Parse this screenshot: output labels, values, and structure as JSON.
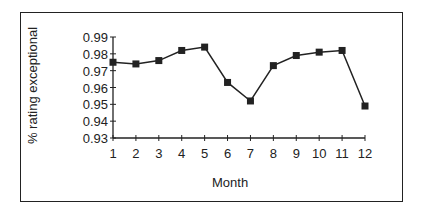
{
  "chart_data": {
    "type": "line",
    "title": "",
    "xlabel": "Month",
    "ylabel": "% rating exceptional",
    "categories": [
      1,
      2,
      3,
      4,
      5,
      6,
      7,
      8,
      9,
      10,
      11,
      12
    ],
    "series": [
      {
        "name": "% rating exceptional",
        "marker": "square",
        "values": [
          0.975,
          0.974,
          0.976,
          0.982,
          0.984,
          0.963,
          0.952,
          0.973,
          0.979,
          0.981,
          0.982,
          0.949
        ]
      }
    ],
    "ylim": [
      0.93,
      0.99
    ],
    "yticks": [
      "0.99",
      "0.98",
      "0.97",
      "0.96",
      "0.95",
      "0.94",
      "0.93"
    ],
    "xticks": [
      "1",
      "2",
      "3",
      "4",
      "5",
      "6",
      "7",
      "8",
      "9",
      "10",
      "11",
      "12"
    ],
    "grid": false,
    "legend": "none",
    "line_color": "#222222"
  }
}
